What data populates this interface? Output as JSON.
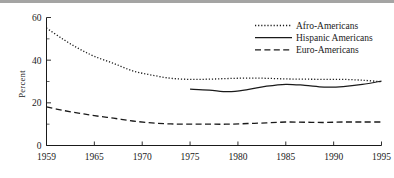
{
  "chart_data": {
    "type": "line",
    "title": "",
    "xlabel": "",
    "ylabel": "Percent",
    "ylim": [
      0,
      60
    ],
    "xlim": [
      1959,
      1995
    ],
    "grid": false,
    "legend_position": "upper right",
    "yticks": [
      0,
      20,
      40,
      60
    ],
    "yticklabels": [
      "0",
      "20",
      "40",
      "60"
    ],
    "yticks_minor": [
      10,
      30,
      50
    ],
    "xticks": [
      1959,
      1965,
      1970,
      1975,
      1980,
      1985,
      1990,
      1995
    ],
    "xticklabels": [
      "1959",
      "1965",
      "1970",
      "1975",
      "1980",
      "1985",
      "1990",
      "1995"
    ],
    "series": [
      {
        "name": "Afro-Americans",
        "style": "dotted",
        "x": [
          1959,
          1961,
          1963,
          1965,
          1967,
          1969,
          1971,
          1973,
          1975,
          1977,
          1979,
          1981,
          1983,
          1985,
          1987,
          1989,
          1991,
          1993,
          1995
        ],
        "values": [
          55.1,
          50.0,
          45.5,
          41.8,
          38.5,
          35.0,
          33.0,
          31.5,
          31.0,
          31.1,
          31.4,
          31.6,
          31.5,
          31.2,
          31.1,
          31.0,
          31.0,
          30.6,
          29.9
        ]
      },
      {
        "name": "Hispanic Americans",
        "style": "solid",
        "x": [
          1975,
          1977,
          1979,
          1981,
          1983,
          1985,
          1987,
          1989,
          1991,
          1993,
          1995
        ],
        "values": [
          26.4,
          26.0,
          25.2,
          26.2,
          27.8,
          28.7,
          28.2,
          27.4,
          27.6,
          28.6,
          30.2
        ]
      },
      {
        "name": "Euro-Americans",
        "style": "dashed",
        "x": [
          1959,
          1961,
          1963,
          1965,
          1967,
          1969,
          1971,
          1973,
          1975,
          1977,
          1979,
          1981,
          1983,
          1985,
          1987,
          1989,
          1991,
          1993,
          1995
        ],
        "values": [
          18.1,
          16.5,
          15.2,
          14.0,
          12.8,
          11.5,
          10.6,
          10.1,
          10.0,
          10.0,
          10.0,
          10.3,
          10.6,
          11.0,
          10.9,
          10.8,
          11.0,
          11.0,
          11.0
        ]
      }
    ]
  },
  "legend": {
    "items": [
      {
        "label": "Afro-Americans",
        "style": "dotted"
      },
      {
        "label": "Hispanic Americans",
        "style": "solid"
      },
      {
        "label": "Euro-Americans",
        "style": "dashed"
      }
    ]
  },
  "axes": {
    "y_title": "Percent"
  }
}
